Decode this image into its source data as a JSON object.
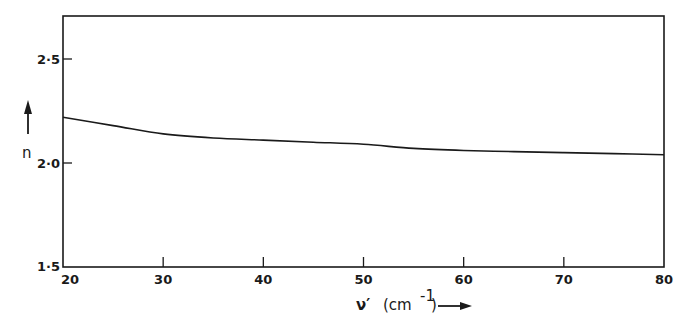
{
  "chart_data": {
    "type": "line",
    "title": "",
    "xlabel": "ν′ (cm⁻¹)",
    "ylabel": "n",
    "xlim": [
      20,
      80
    ],
    "ylim": [
      1.5,
      2.71
    ],
    "x_ticks": [
      20,
      30,
      40,
      50,
      60,
      70,
      80
    ],
    "x_tick_labels": [
      "20",
      "30",
      "40",
      "50",
      "60",
      "70",
      "80"
    ],
    "y_ticks": [
      1.5,
      2.0,
      2.5
    ],
    "y_tick_labels": [
      "1·5",
      "2·0",
      "2·5"
    ],
    "grid": false,
    "legend": null,
    "series": [
      {
        "name": "n",
        "x": [
          20,
          25,
          30,
          35,
          40,
          45,
          50,
          55,
          60,
          65,
          70,
          75,
          80
        ],
        "values": [
          2.22,
          2.18,
          2.14,
          2.12,
          2.11,
          2.1,
          2.09,
          2.07,
          2.06,
          2.055,
          2.05,
          2.045,
          2.04
        ]
      }
    ]
  },
  "labels": {
    "y_axis": "n",
    "x_axis_symbol": "ν′",
    "x_axis_unit_prefix": "(cm",
    "x_axis_unit_exp": "-1",
    "x_axis_unit_suffix": ")"
  }
}
